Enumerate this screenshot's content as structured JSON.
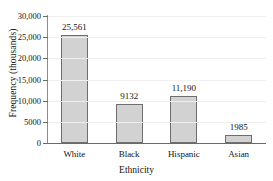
{
  "chart_data": {
    "type": "bar",
    "title": "",
    "categories": [
      "White",
      "Black",
      "Hispanic",
      "Asian"
    ],
    "values": [
      25561,
      9132,
      11190,
      1985
    ],
    "value_labels": [
      "25,561",
      "9132",
      "11,190",
      "1985"
    ],
    "xlabel": "Ethnicity",
    "ylabel": "Frequency (thousands)",
    "ylim": [
      0,
      30000
    ],
    "ytick_values": [
      0,
      5000,
      10000,
      15000,
      20000,
      25000,
      30000
    ],
    "ytick_labels": [
      "0",
      "5000",
      "10,000",
      "15,000",
      "20,000",
      "25,000",
      "30,000"
    ],
    "grid": true,
    "legend": false,
    "bar_color": "#d2d2d2",
    "bar_edge_color": "#6e6e6e",
    "axis_color": "#6b6b6b",
    "gridline_color": "#f0f0f0",
    "text_color": "#141414"
  }
}
